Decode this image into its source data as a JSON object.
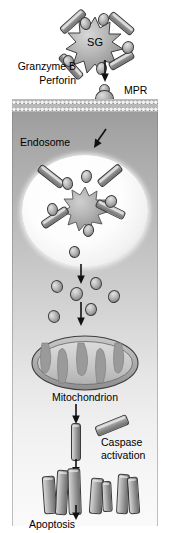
{
  "figure": {
    "background_color": "#ffffff",
    "cell_interior_gradient": [
      "#9d9d9d",
      "#fafafa"
    ],
    "outline_color": "#3a3a3a"
  },
  "labels": {
    "granule": "SG",
    "granzyme_b": "Granzyme B",
    "perforin": "Perforin",
    "mpr": "MPR",
    "endosome": "Endosome",
    "mitochondrion": "Mitochondrion",
    "caspase_activation": "Caspase\nactivation",
    "apoptosis": "Apoptosis"
  },
  "structures": {
    "plasma_membrane": {
      "name": "lipid-bilayer",
      "leaflets": 2
    },
    "secretory_granule": {
      "name": "SG",
      "shape": "starburst",
      "points": 11
    },
    "mpr_receptor": {
      "name": "mannose-6-phosphate-receptor",
      "abbr": "MPR"
    },
    "endosome": {
      "name": "endosome",
      "shape": "ellipse",
      "fill": "#ffffff"
    },
    "mitochondrion": {
      "name": "mitochondrion",
      "shape": "ellipse-with-cristae",
      "cristae": 5
    }
  },
  "particles": {
    "perforin_rods_extracellular": [
      {
        "x": 58,
        "y": 17,
        "w": 30,
        "h": 9,
        "rot": -42
      },
      {
        "x": 107,
        "y": 19,
        "w": 29,
        "h": 9,
        "rot": 40
      },
      {
        "x": 56,
        "y": 62,
        "w": 30,
        "h": 9,
        "rot": 48
      },
      {
        "x": 108,
        "y": 56,
        "w": 27,
        "h": 9,
        "rot": -30
      },
      {
        "x": 62,
        "y": 41,
        "w": 22,
        "h": 9,
        "rot": -8
      }
    ],
    "granzyme_ovals_extracellular": [
      {
        "x": 80,
        "y": 18,
        "w": 11,
        "h": 13,
        "rot": -18
      },
      {
        "x": 97,
        "y": 13,
        "w": 11,
        "h": 13,
        "rot": 12
      },
      {
        "x": 121,
        "y": 41,
        "w": 12,
        "h": 13,
        "rot": 22
      },
      {
        "x": 96,
        "y": 62,
        "w": 11,
        "h": 13,
        "rot": 8
      },
      {
        "x": 63,
        "y": 56,
        "w": 11,
        "h": 12,
        "rot": -24
      }
    ],
    "endosome_rods": [
      {
        "x": 36,
        "y": 172,
        "w": 30,
        "h": 9,
        "rot": 38
      },
      {
        "x": 96,
        "y": 171,
        "w": 28,
        "h": 9,
        "rot": -40
      },
      {
        "x": 95,
        "y": 205,
        "w": 31,
        "h": 9,
        "rot": 26
      },
      {
        "x": 40,
        "y": 213,
        "w": 30,
        "h": 9,
        "rot": -34
      }
    ],
    "endosome_ovals": [
      {
        "x": 62,
        "y": 177,
        "w": 11,
        "h": 13,
        "rot": -14
      },
      {
        "x": 80,
        "y": 170,
        "w": 11,
        "h": 13,
        "rot": 10
      },
      {
        "x": 104,
        "y": 195,
        "w": 12,
        "h": 13,
        "rot": 28
      },
      {
        "x": 47,
        "y": 203,
        "w": 11,
        "h": 13,
        "rot": -8
      },
      {
        "x": 82,
        "y": 224,
        "w": 11,
        "h": 13,
        "rot": 16
      },
      {
        "x": 69,
        "y": 246,
        "w": 11,
        "h": 12,
        "rot": -6
      }
    ],
    "released_granzymes": [
      {
        "x": 51,
        "y": 274,
        "w": 12,
        "h": 13,
        "rot": -20
      },
      {
        "x": 69,
        "y": 281,
        "w": 13,
        "h": 14,
        "rot": 16
      },
      {
        "x": 88,
        "y": 268,
        "w": 12,
        "h": 13,
        "rot": -10
      },
      {
        "x": 106,
        "y": 284,
        "w": 12,
        "h": 13,
        "rot": 24
      },
      {
        "x": 83,
        "y": 297,
        "w": 12,
        "h": 13,
        "rot": 8
      },
      {
        "x": 53,
        "y": 303,
        "w": 12,
        "h": 13,
        "rot": -26
      }
    ],
    "procaspase_rod": {
      "x": 71,
      "y": 403,
      "w": 9,
      "h": 40
    },
    "caspase_rod_free": {
      "x": 95,
      "y": 408,
      "w": 34,
      "h": 11,
      "rot": -22
    },
    "caspase_fragments": [
      {
        "x": 46,
        "y": 460,
        "w": 12,
        "h": 38,
        "rot": -4
      },
      {
        "x": 58,
        "y": 455,
        "w": 11,
        "h": 44,
        "rot": 3
      },
      {
        "x": 69,
        "y": 452,
        "w": 12,
        "h": 46,
        "rot": -2
      },
      {
        "x": 89,
        "y": 462,
        "w": 12,
        "h": 36,
        "rot": 4
      },
      {
        "x": 100,
        "y": 465,
        "w": 10,
        "h": 31,
        "rot": -3
      },
      {
        "x": 114,
        "y": 459,
        "w": 11,
        "h": 39,
        "rot": 3
      },
      {
        "x": 124,
        "y": 461,
        "w": 11,
        "h": 37,
        "rot": -4
      }
    ]
  },
  "arrows": [
    {
      "name": "granule-release-arrow",
      "x": 104,
      "y": 62,
      "len": 18,
      "dir": "down"
    },
    {
      "name": "endocytosis-arrow",
      "x": 97,
      "y": 131,
      "len": 17,
      "dir": "down-left"
    },
    {
      "name": "endosome-release-arrow",
      "x": 81,
      "y": 262,
      "len": 17,
      "dir": "down"
    },
    {
      "name": "to-mitochondrion-arrow",
      "x": 81,
      "y": 300,
      "len": 20,
      "dir": "down"
    },
    {
      "name": "mito-to-caspase-arrow",
      "x": 76,
      "y": 383,
      "len": 18,
      "dir": "down"
    },
    {
      "name": "caspase-cleavage-arrow",
      "x": 76,
      "y": 440,
      "len": 13,
      "dir": "down"
    },
    {
      "name": "to-apoptosis-arrow",
      "x": 76,
      "y": 498,
      "len": 13,
      "dir": "down"
    }
  ]
}
